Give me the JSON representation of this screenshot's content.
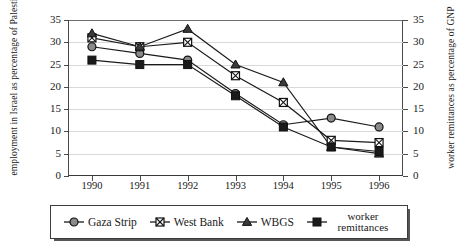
{
  "axis_titles": {
    "left": "employment in Israel as percentage of Palestinian labor force",
    "right": "worker remittances as percentage of GNP"
  },
  "legend": {
    "items": [
      {
        "label": "Gaza Strip",
        "marker": "circle-marker",
        "color": "#808080"
      },
      {
        "label": "West Bank",
        "marker": "crossed-square-marker",
        "color": "#ffffff"
      },
      {
        "label": "WBGS",
        "marker": "triangle-marker",
        "color": "#3a3a3a"
      },
      {
        "label": "worker remittances",
        "marker": "filled-square-marker",
        "color": "#1a1a1a"
      }
    ]
  },
  "chart_data": {
    "type": "line",
    "title": "",
    "xlabel": "",
    "ylabel": "employment in Israel as percentage of Palestinian labor force",
    "y2label": "worker remittances as percentage of GNP",
    "categories": [
      "1990",
      "1991",
      "1992",
      "1993",
      "1994",
      "1995",
      "1996"
    ],
    "ylim": [
      0,
      35
    ],
    "yticks": [
      0,
      5,
      10,
      15,
      20,
      25,
      30,
      35
    ],
    "y2lim": [
      0,
      35
    ],
    "y2ticks": [
      0,
      5,
      10,
      15,
      20,
      25,
      30,
      35
    ],
    "grid": true,
    "legend_position": "bottom",
    "series": [
      {
        "name": "Gaza Strip",
        "axis": "left",
        "values": [
          29,
          27.5,
          26,
          18.5,
          11.5,
          13,
          11
        ]
      },
      {
        "name": "West Bank",
        "axis": "left",
        "values": [
          31,
          29,
          30,
          22.5,
          16.5,
          8,
          7.5
        ]
      },
      {
        "name": "WBGS",
        "axis": "left",
        "values": [
          32,
          29,
          33,
          25,
          21,
          6.5,
          5
        ]
      },
      {
        "name": "worker remittances",
        "axis": "right",
        "values": [
          26,
          25,
          25,
          18,
          11,
          6.5,
          5.5
        ]
      }
    ]
  }
}
